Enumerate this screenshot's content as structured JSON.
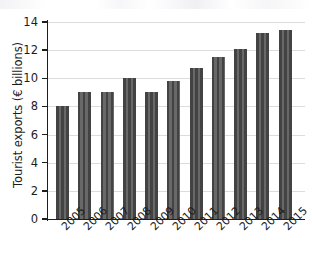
{
  "chart_data": {
    "type": "bar",
    "title": "",
    "subtitle": "",
    "xlabel": "",
    "ylabel": "Tourist exports (€ billions)",
    "categories": [
      "2005",
      "2006",
      "2007",
      "2008",
      "2009",
      "2010",
      "2011",
      "2012",
      "2013",
      "2014",
      "2015"
    ],
    "values": [
      8.0,
      9.0,
      9.0,
      10.0,
      9.0,
      9.8,
      10.75,
      11.5,
      12.1,
      13.2,
      13.45
    ],
    "series": [
      {
        "name": "Tourist exports",
        "values": [
          8.0,
          9.0,
          9.0,
          10.0,
          9.0,
          9.8,
          10.75,
          11.5,
          12.1,
          13.2,
          13.45
        ]
      }
    ],
    "ylim": [
      0,
      14
    ],
    "yticks": [
      0,
      2,
      4,
      6,
      8,
      10,
      12,
      14
    ],
    "ytick_labels": [
      "0",
      "2",
      "4",
      "6",
      "8",
      "10",
      "12",
      "14"
    ],
    "grid": "horizontal",
    "legend": "none",
    "bar_color": "#434343",
    "gridline_color": "#dcdcdc",
    "axis_color": "#1d1d1d",
    "xtick_rotation": -45,
    "annotations": []
  }
}
